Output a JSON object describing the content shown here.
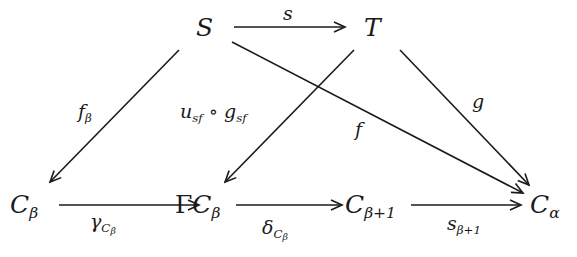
{
  "diagram": {
    "type": "commutative-diagram",
    "stroke_color": "#1a1a1a",
    "background": "#ffffff",
    "nodes": {
      "S": {
        "main": "S",
        "sub": ""
      },
      "T": {
        "main": "T",
        "sub": ""
      },
      "C_beta": {
        "main": "C",
        "sub": "β"
      },
      "GammaC_beta": {
        "prefix": "Γ",
        "main": "C",
        "sub": "β"
      },
      "C_beta_plus_1": {
        "main": "C",
        "sub": "β+1"
      },
      "C_alpha": {
        "main": "C",
        "sub": "α"
      }
    },
    "edges": [
      {
        "id": "s",
        "from": "S",
        "to": "T",
        "label": {
          "main": "s",
          "sub": ""
        }
      },
      {
        "id": "f_beta",
        "from": "S",
        "to": "C_beta",
        "label": {
          "main": "f",
          "sub": "β"
        }
      },
      {
        "id": "u_g",
        "from": "T",
        "to": "GammaC_beta",
        "label": {
          "u": "u",
          "u_sub": "sf",
          "op": "∘",
          "g": "g",
          "g_sub": "sf"
        }
      },
      {
        "id": "f",
        "from": "S",
        "to": "C_alpha",
        "label": {
          "main": "f",
          "sub": ""
        }
      },
      {
        "id": "g",
        "from": "T",
        "to": "C_alpha",
        "label": {
          "main": "g",
          "sub": ""
        }
      },
      {
        "id": "gamma",
        "from": "C_beta",
        "to": "GammaC_beta",
        "label": {
          "main": "γ",
          "sub_main": "C",
          "sub_sub": "β"
        }
      },
      {
        "id": "delta",
        "from": "GammaC_beta",
        "to": "C_beta_plus_1",
        "label": {
          "main": "δ",
          "sub_main": "C",
          "sub_sub": "β"
        }
      },
      {
        "id": "s_beta_plus_1",
        "from": "C_beta_plus_1",
        "to": "C_alpha",
        "label": {
          "main": "s",
          "sub": "β+1"
        }
      }
    ]
  }
}
